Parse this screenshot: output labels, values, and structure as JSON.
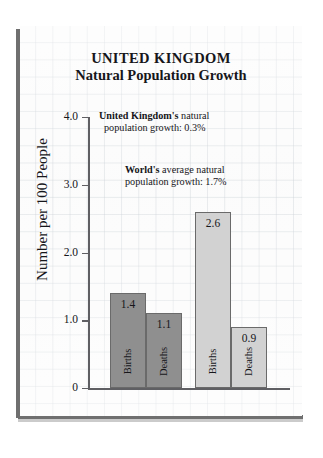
{
  "title": {
    "line1": "UNITED KINGDOM",
    "line2": "Natural Population Growth"
  },
  "annotations": {
    "uk": {
      "bold": "United Kingdom's",
      "rest": " natural",
      "line2": "population growth:  0.3%"
    },
    "world": {
      "bold": "World's",
      "rest": " average natural",
      "line2": "population growth:  1.7%"
    }
  },
  "axis": {
    "y_title": "Number per 100 People",
    "y_ticks": [
      "4.0",
      "3.0",
      "2.0",
      "1.0",
      "0"
    ]
  },
  "colors": {
    "uk_bar": "#8f8f8f",
    "world_bar": "#d2d2d2",
    "axis": "#5f5f63",
    "text": "#16161a",
    "paper": "#fbfbfb"
  },
  "chart_data": {
    "type": "bar",
    "title": "UNITED KINGDOM Natural Population Growth",
    "xlabel": "",
    "ylabel": "Number per 100 People",
    "ylim": [
      0,
      4.0
    ],
    "yticks": [
      0,
      1.0,
      2.0,
      3.0,
      4.0
    ],
    "grid": false,
    "legend": "none",
    "groups": [
      {
        "name": "United Kingdom",
        "color": "#8f8f8f",
        "note": "United Kingdom's natural population growth:  0.3%",
        "bars": [
          {
            "category": "Births",
            "value": 1.4,
            "label": "1.4"
          },
          {
            "category": "Deaths",
            "value": 1.1,
            "label": "1.1"
          }
        ]
      },
      {
        "name": "World",
        "color": "#d2d2d2",
        "note": "World's average natural population growth:  1.7%",
        "bars": [
          {
            "category": "Births",
            "value": 2.6,
            "label": "2.6"
          },
          {
            "category": "Deaths",
            "value": 0.9,
            "label": "0.9"
          }
        ]
      }
    ],
    "categories": [
      "Births (UK)",
      "Deaths (UK)",
      "Births (World)",
      "Deaths (World)"
    ],
    "values": [
      1.4,
      1.1,
      2.6,
      0.9
    ]
  }
}
